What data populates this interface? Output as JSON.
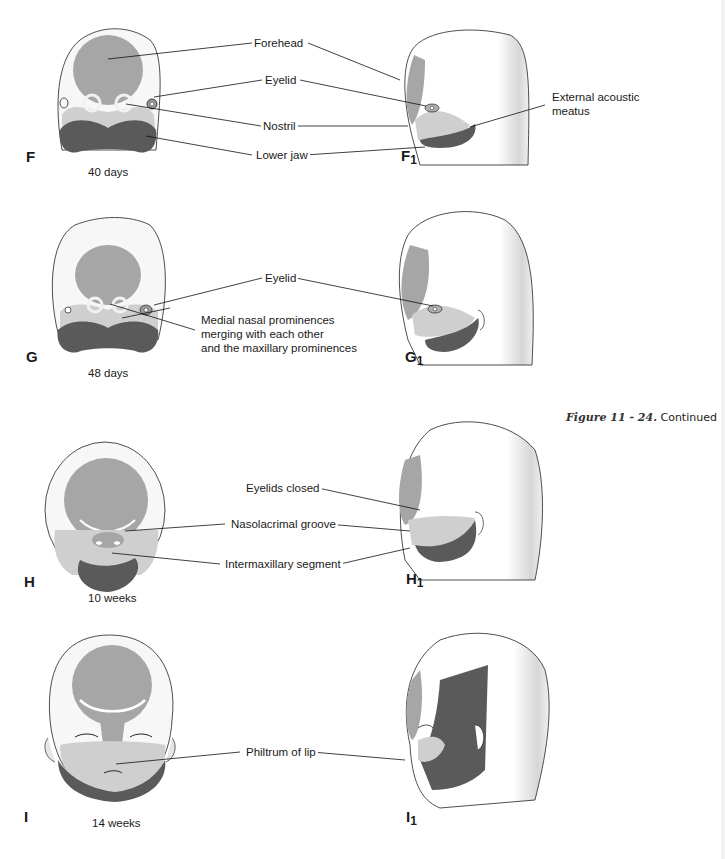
{
  "figure": {
    "caption_ref": "Figure 11 - 24.",
    "caption_text": "Continued",
    "colors": {
      "background": "#ffffff",
      "skin_white": "#f7f7f7",
      "forehead_gray": "#a6a6a6",
      "maxillary_light_gray": "#cfcfcf",
      "mandible_dark_gray": "#5a5a5a",
      "outline": "#222222",
      "leader_line": "#111111"
    },
    "panels": [
      {
        "id": "F",
        "letter": "F",
        "view": "frontal",
        "age": "40 days"
      },
      {
        "id": "F1",
        "letter": "F",
        "subscript": "1",
        "view": "lateral"
      },
      {
        "id": "G",
        "letter": "G",
        "view": "frontal",
        "age": "48 days"
      },
      {
        "id": "G1",
        "letter": "G",
        "subscript": "1",
        "view": "lateral"
      },
      {
        "id": "H",
        "letter": "H",
        "view": "frontal",
        "age": "10 weeks"
      },
      {
        "id": "H1",
        "letter": "H",
        "subscript": "1",
        "view": "lateral"
      },
      {
        "id": "I",
        "letter": "I",
        "view": "frontal",
        "age": "14 weeks"
      },
      {
        "id": "I1",
        "letter": "I",
        "subscript": "1",
        "view": "lateral"
      }
    ],
    "labels": {
      "forehead": "Forehead",
      "eyelid_f": "Eyelid",
      "nostril": "Nostril",
      "lower_jaw": "Lower jaw",
      "external_acoustic_meatus_1": "External acoustic",
      "external_acoustic_meatus_2": "meatus",
      "eyelid_g": "Eyelid",
      "medial_nasal_1": "Medial nasal prominences",
      "medial_nasal_2": "merging with each other",
      "medial_nasal_3": "and the maxillary prominences",
      "eyelids_closed": "Eyelids closed",
      "nasolacrimal_groove": "Nasolacrimal groove",
      "intermaxillary_segment": "Intermaxillary segment",
      "philtrum_of_lip": "Philtrum of lip"
    }
  }
}
